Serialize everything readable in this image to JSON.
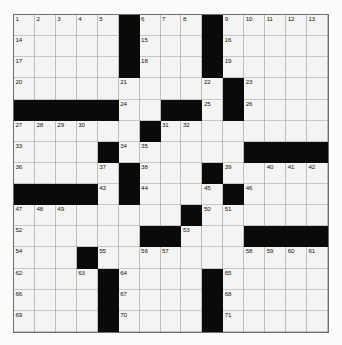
{
  "puzzle": {
    "type": "crossword-grid",
    "rows": 15,
    "columns": 15,
    "cell_background_color": "#f4f4f2",
    "block_color": "#0a0a0a",
    "grid_line_color": "#9a9a9a",
    "page_background_color": "#fbfbfb",
    "blocks": [
      [
        1,
        6
      ],
      [
        1,
        10
      ],
      [
        2,
        6
      ],
      [
        2,
        10
      ],
      [
        3,
        6
      ],
      [
        3,
        10
      ],
      [
        4,
        11
      ],
      [
        5,
        1
      ],
      [
        5,
        2
      ],
      [
        5,
        3
      ],
      [
        5,
        4
      ],
      [
        5,
        5
      ],
      [
        5,
        8
      ],
      [
        5,
        9
      ],
      [
        5,
        11
      ],
      [
        6,
        7
      ],
      [
        7,
        5
      ],
      [
        7,
        12
      ],
      [
        7,
        13
      ],
      [
        7,
        14
      ],
      [
        7,
        15
      ],
      [
        8,
        6
      ],
      [
        8,
        10
      ],
      [
        9,
        1
      ],
      [
        9,
        2
      ],
      [
        9,
        3
      ],
      [
        9,
        4
      ],
      [
        9,
        6
      ],
      [
        9,
        11
      ],
      [
        10,
        9
      ],
      [
        11,
        7
      ],
      [
        11,
        8
      ],
      [
        11,
        12
      ],
      [
        11,
        13
      ],
      [
        11,
        14
      ],
      [
        11,
        15
      ],
      [
        12,
        4
      ],
      [
        13,
        5
      ],
      [
        13,
        10
      ],
      [
        14,
        5
      ],
      [
        14,
        10
      ],
      [
        15,
        5
      ],
      [
        15,
        10
      ]
    ],
    "numbers": [
      {
        "row": 1,
        "col": 1,
        "label": "1"
      },
      {
        "row": 1,
        "col": 2,
        "label": "2"
      },
      {
        "row": 1,
        "col": 3,
        "label": "3"
      },
      {
        "row": 1,
        "col": 4,
        "label": "4"
      },
      {
        "row": 1,
        "col": 5,
        "label": "5"
      },
      {
        "row": 1,
        "col": 7,
        "label": "6"
      },
      {
        "row": 1,
        "col": 8,
        "label": "7"
      },
      {
        "row": 1,
        "col": 9,
        "label": "8"
      },
      {
        "row": 1,
        "col": 11,
        "label": "9"
      },
      {
        "row": 1,
        "col": 12,
        "label": "10"
      },
      {
        "row": 1,
        "col": 13,
        "label": "11"
      },
      {
        "row": 1,
        "col": 14,
        "label": "12"
      },
      {
        "row": 1,
        "col": 15,
        "label": "13"
      },
      {
        "row": 2,
        "col": 1,
        "label": "14"
      },
      {
        "row": 2,
        "col": 7,
        "label": "15"
      },
      {
        "row": 2,
        "col": 11,
        "label": "16"
      },
      {
        "row": 3,
        "col": 1,
        "label": "17"
      },
      {
        "row": 3,
        "col": 7,
        "label": "18"
      },
      {
        "row": 3,
        "col": 11,
        "label": "19"
      },
      {
        "row": 4,
        "col": 1,
        "label": "20"
      },
      {
        "row": 4,
        "col": 6,
        "label": "21"
      },
      {
        "row": 4,
        "col": 10,
        "label": "22"
      },
      {
        "row": 4,
        "col": 12,
        "label": "23"
      },
      {
        "row": 5,
        "col": 6,
        "label": "24"
      },
      {
        "row": 5,
        "col": 10,
        "label": "25"
      },
      {
        "row": 5,
        "col": 12,
        "label": "26"
      },
      {
        "row": 6,
        "col": 1,
        "label": "27"
      },
      {
        "row": 6,
        "col": 2,
        "label": "28"
      },
      {
        "row": 6,
        "col": 3,
        "label": "29"
      },
      {
        "row": 6,
        "col": 4,
        "label": "30"
      },
      {
        "row": 6,
        "col": 8,
        "label": "31"
      },
      {
        "row": 6,
        "col": 9,
        "label": "32"
      },
      {
        "row": 7,
        "col": 1,
        "label": "33"
      },
      {
        "row": 7,
        "col": 6,
        "label": "34"
      },
      {
        "row": 7,
        "col": 7,
        "label": "35"
      },
      {
        "row": 8,
        "col": 1,
        "label": "36"
      },
      {
        "row": 8,
        "col": 5,
        "label": "37"
      },
      {
        "row": 8,
        "col": 7,
        "label": "38"
      },
      {
        "row": 8,
        "col": 11,
        "label": "39"
      },
      {
        "row": 8,
        "col": 13,
        "label": "40"
      },
      {
        "row": 8,
        "col": 14,
        "label": "41"
      },
      {
        "row": 8,
        "col": 15,
        "label": "42"
      },
      {
        "row": 9,
        "col": 5,
        "label": "43"
      },
      {
        "row": 9,
        "col": 7,
        "label": "44"
      },
      {
        "row": 9,
        "col": 10,
        "label": "45"
      },
      {
        "row": 9,
        "col": 12,
        "label": "46"
      },
      {
        "row": 10,
        "col": 1,
        "label": "47"
      },
      {
        "row": 10,
        "col": 2,
        "label": "48"
      },
      {
        "row": 10,
        "col": 3,
        "label": "49"
      },
      {
        "row": 10,
        "col": 10,
        "label": "50"
      },
      {
        "row": 10,
        "col": 11,
        "label": "51"
      },
      {
        "row": 11,
        "col": 1,
        "label": "52"
      },
      {
        "row": 11,
        "col": 9,
        "label": "53"
      },
      {
        "row": 12,
        "col": 1,
        "label": "54"
      },
      {
        "row": 12,
        "col": 5,
        "label": "55"
      },
      {
        "row": 12,
        "col": 7,
        "label": "56"
      },
      {
        "row": 12,
        "col": 8,
        "label": "57"
      },
      {
        "row": 12,
        "col": 12,
        "label": "58"
      },
      {
        "row": 12,
        "col": 13,
        "label": "59"
      },
      {
        "row": 12,
        "col": 14,
        "label": "60"
      },
      {
        "row": 12,
        "col": 15,
        "label": "61"
      },
      {
        "row": 13,
        "col": 1,
        "label": "62"
      },
      {
        "row": 13,
        "col": 4,
        "label": "63"
      },
      {
        "row": 13,
        "col": 6,
        "label": "64"
      },
      {
        "row": 13,
        "col": 11,
        "label": "65"
      },
      {
        "row": 14,
        "col": 1,
        "label": "66"
      },
      {
        "row": 14,
        "col": 6,
        "label": "67"
      },
      {
        "row": 14,
        "col": 11,
        "label": "68"
      },
      {
        "row": 15,
        "col": 1,
        "label": "69"
      },
      {
        "row": 15,
        "col": 6,
        "label": "70"
      },
      {
        "row": 15,
        "col": 11,
        "label": "71"
      }
    ]
  }
}
